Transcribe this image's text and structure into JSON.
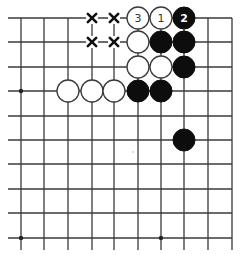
{
  "diagram": {
    "type": "go-board-fragment",
    "columns_px": [
      21,
      44,
      68,
      92,
      114,
      138,
      161,
      184,
      208,
      232
    ],
    "rows_px": [
      18,
      42,
      67,
      91,
      116,
      140,
      164,
      189,
      213,
      238
    ],
    "edges": {
      "top": true,
      "right": true,
      "left": false,
      "bottom": false
    },
    "line_extent": {
      "left_x": 8,
      "bottom_y": 250
    },
    "colors": {
      "line": "#3a3a3a",
      "black_stone": "#0d0d0d",
      "white_stone": "#ffffff",
      "mark": "#111111"
    },
    "stone_radius": 11,
    "star_points": [
      {
        "col": 0,
        "row": 3
      },
      {
        "col": 0,
        "row": 9
      },
      {
        "col": 6,
        "row": 9
      }
    ],
    "stones": [
      {
        "col": 5,
        "row": 0,
        "color": "white",
        "label": "3"
      },
      {
        "col": 6,
        "row": 0,
        "color": "white",
        "label": "1"
      },
      {
        "col": 7,
        "row": 0,
        "color": "black",
        "label": "2"
      },
      {
        "col": 5,
        "row": 1,
        "color": "white",
        "label": ""
      },
      {
        "col": 6,
        "row": 1,
        "color": "black",
        "label": ""
      },
      {
        "col": 7,
        "row": 1,
        "color": "black",
        "label": ""
      },
      {
        "col": 5,
        "row": 2,
        "color": "white",
        "label": ""
      },
      {
        "col": 6,
        "row": 2,
        "color": "white",
        "label": ""
      },
      {
        "col": 7,
        "row": 2,
        "color": "black",
        "label": ""
      },
      {
        "col": 2,
        "row": 3,
        "color": "white",
        "label": ""
      },
      {
        "col": 3,
        "row": 3,
        "color": "white",
        "label": ""
      },
      {
        "col": 4,
        "row": 3,
        "color": "white",
        "label": ""
      },
      {
        "col": 5,
        "row": 3,
        "color": "black",
        "label": ""
      },
      {
        "col": 6,
        "row": 3,
        "color": "black",
        "label": ""
      },
      {
        "col": 7,
        "row": 5,
        "color": "black",
        "label": ""
      }
    ],
    "x_marks": [
      {
        "col": 3,
        "row": 0
      },
      {
        "col": 4,
        "row": 0
      },
      {
        "col": 3,
        "row": 1
      },
      {
        "col": 4,
        "row": 1
      }
    ],
    "move_labels": [
      "1",
      "2",
      "3"
    ]
  }
}
